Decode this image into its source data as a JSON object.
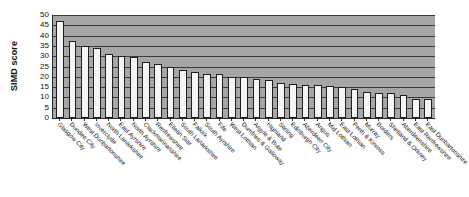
{
  "chart_data": {
    "type": "bar",
    "title": "",
    "xlabel": "",
    "ylabel": "SIMD score",
    "ylim": [
      0,
      50
    ],
    "ytick_step": 5,
    "yticks": [
      50,
      45,
      40,
      35,
      30,
      25,
      20,
      15,
      10,
      5,
      0
    ],
    "grid": true,
    "legend": "none",
    "plot_background": "#a6a6a6",
    "bar_fill": "#f4f4f4",
    "bar_edge": "#1f1f1f",
    "categories": [
      "Glasgow City",
      "Dundee City",
      "West Dunbartonshire",
      "Inverclyde",
      "North Lanarkshire",
      "East Ayrshire",
      "North Ayrshire",
      "Clackmannanshire",
      "Renfrewshire",
      "Eilean Siar",
      "South Lanarkshire",
      "Falkirk",
      "South Ayrshire",
      "Fife",
      "West Lothian",
      "Dumfries & Galloway",
      "Argyle & Bute",
      "Highland",
      "Stirling",
      "Edinburgh City",
      "Aberdeen City",
      "Angus",
      "Mid Lothian",
      "East Lothian",
      "Perth & Kinross",
      "Murray",
      "Borders",
      "Shetland & Orkney",
      "Aberdeenshire",
      "East Renfrewshire",
      "East Dunbartonshire"
    ],
    "values": [
      47.0,
      37.5,
      35.0,
      34.0,
      31.0,
      30.3,
      29.5,
      27.4,
      26.0,
      24.7,
      23.3,
      22.4,
      21.5,
      21.5,
      20.0,
      20.0,
      19.0,
      18.4,
      17.0,
      16.5,
      16.2,
      16.0,
      15.3,
      15.2,
      14.3,
      12.4,
      12.0,
      12.0,
      11.1,
      9.4,
      9.3
    ]
  }
}
